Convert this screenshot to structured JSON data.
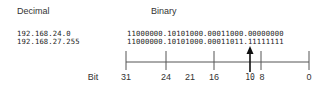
{
  "headers": {
    "decimal": "Decimal",
    "binary": "Binary"
  },
  "rows": [
    {
      "decimal": "192.168.24.0",
      "binary": "11000000.10101000.00011000.00000000"
    },
    {
      "decimal": "192.168.27.255",
      "binary": "11000000.10101000.00011011.11111111"
    }
  ],
  "ruler": {
    "axis_label": "Bit",
    "ticks": [
      "31",
      "24",
      "16",
      "8",
      "0"
    ],
    "extra_label": "21",
    "arrow_label": "10"
  }
}
